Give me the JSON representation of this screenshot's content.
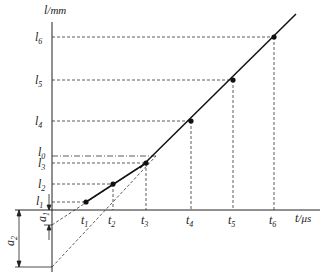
{
  "diagram": {
    "y_axis_label": {
      "var": "l",
      "unit": "/mm"
    },
    "x_axis_label": {
      "var": "t",
      "unit": "/μs"
    },
    "y_levels": [
      {
        "name": "l",
        "sub": "6"
      },
      {
        "name": "l",
        "sub": "5"
      },
      {
        "name": "l",
        "sub": "4"
      },
      {
        "name": "l",
        "sub": "0"
      },
      {
        "name": "l",
        "sub": "3"
      },
      {
        "name": "l",
        "sub": "2"
      },
      {
        "name": "l",
        "sub": "1"
      }
    ],
    "x_ticks": [
      {
        "name": "t",
        "sub": "1"
      },
      {
        "name": "t",
        "sub": "2"
      },
      {
        "name": "t",
        "sub": "3"
      },
      {
        "name": "t",
        "sub": "4"
      },
      {
        "name": "t",
        "sub": "5"
      },
      {
        "name": "t",
        "sub": "6"
      }
    ],
    "offsets": [
      {
        "name": "a",
        "sub": "1"
      },
      {
        "name": "a",
        "sub": "2"
      }
    ],
    "colors": {
      "line": "#1a1a1a",
      "dash": "#333333",
      "point": "#111111"
    }
  }
}
